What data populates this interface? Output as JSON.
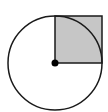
{
  "diagram": {
    "colors": {
      "background": "#ffffff",
      "stroke": "#1a1a1a",
      "square_fill": "#c6c6c6",
      "center_dot": "#000000"
    },
    "circle": {
      "cx": 55,
      "cy": 63,
      "r": 47
    },
    "square": {
      "x": 55,
      "y": 16,
      "width": 47,
      "height": 47
    },
    "center_point": {
      "cx": 55,
      "cy": 63,
      "r": 3.5
    }
  }
}
